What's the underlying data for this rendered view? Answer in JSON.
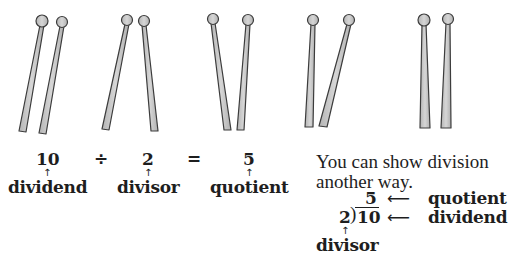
{
  "illustration": {
    "description": "Five pairs of sticks, each pair grouped together, illustrating 10 sticks divided into groups of 2",
    "groups": 5,
    "sticks_per_group": 2,
    "stick_fill": "#c9c9c9",
    "stick_outline": "#3c3c3c"
  },
  "equation": {
    "dividend_value": "10",
    "divide_sign": "÷",
    "divisor_value": "2",
    "equals_sign": "=",
    "quotient_value": "5",
    "arrow": "↑",
    "dividend_label": "dividend",
    "divisor_label": "divisor",
    "quotient_label": "quotient"
  },
  "alternate": {
    "line1": "You can show division",
    "line2": "another way.",
    "quotient_value": "5",
    "divisor_value": "2",
    "bracket": ")",
    "dividend_value": "10",
    "left_arrow": "⟵",
    "up_arrow": "↑",
    "quotient_label": "quotient",
    "dividend_label": "dividend",
    "divisor_label": "divisor"
  }
}
